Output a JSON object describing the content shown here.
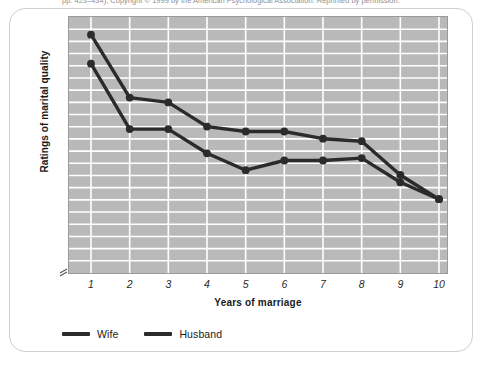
{
  "attribution": {
    "text": "pp. 423–434), Copyright © 1999 by the American Psychological Association. Reprinted by permission."
  },
  "chart_data": {
    "type": "line",
    "title": "",
    "xlabel": "Years of marriage",
    "ylabel": "Ratings of marital quality",
    "x": [
      1,
      2,
      3,
      4,
      5,
      6,
      7,
      8,
      9,
      10
    ],
    "categories": [
      "1",
      "2",
      "3",
      "4",
      "5",
      "6",
      "7",
      "8",
      "9",
      "10"
    ],
    "xlim": [
      1,
      10
    ],
    "ylim": [
      0,
      100
    ],
    "y_axis_ticks_labeled": false,
    "y_axis_break": true,
    "grid": true,
    "grid_horizontal_lines": 20,
    "grid_vertical_lines": 10,
    "legend_position": "below-left",
    "plot_background_color": "#b9b9b9",
    "grid_color": "#ffffff",
    "series": [
      {
        "name": "Wife",
        "color": "#2b2b2b",
        "values": [
          96,
          70,
          68,
          58,
          56,
          56,
          53,
          52,
          38,
          28
        ]
      },
      {
        "name": "Husband",
        "color": "#2b2b2b",
        "values": [
          84,
          57,
          57,
          47,
          40,
          44,
          44,
          45,
          35,
          28
        ]
      }
    ]
  },
  "legend": {
    "items": [
      {
        "label": "Wife",
        "color": "#2b2b2b"
      },
      {
        "label": "Husband",
        "color": "#2b2b2b"
      }
    ]
  }
}
